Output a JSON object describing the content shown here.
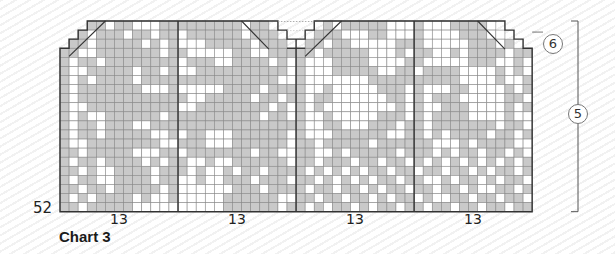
{
  "title": "Chart 3",
  "row_number_label": "52",
  "repeat_labels": [
    "13",
    "13",
    "13",
    "13"
  ],
  "annotations": {
    "circle_top": "6",
    "circle_side": "5"
  },
  "colors": {
    "shaded": "#c9c9c9",
    "white": "#ffffff",
    "gridline": "#8a8a8a",
    "outline": "#333333"
  },
  "grid": {
    "columns": 52,
    "rows": 21,
    "cell_size": 9.08,
    "origin_x": 60,
    "origin_y": 21,
    "panel_dividers": [
      13,
      26,
      39
    ],
    "top_shape": {
      "row_start_cols": [
        [
          3,
          23,
          29,
          48
        ],
        [
          2,
          24,
          28,
          49
        ],
        [
          1,
          25,
          27,
          50
        ]
      ],
      "full_from_row": 3
    },
    "cells": [
      "-1,-1,-1,1,1,0,1,1,0,0,0,1,1,1,1,1,1,1,1,1,0,1,1,-1,-1,-1,-1,-1,-1,1,0,1,1,1,1,1,0,0,0,1,0,0,0,1,1,1,1,0,-1,-1,-1,-1",
      "-1,-1,1,0,1,1,1,0,1,1,0,1,1,0,1,1,1,1,1,1,0,1,1,1,-1,-1,-1,-1,1,1,1,0,0,0,1,1,0,0,0,1,0,0,0,0,1,1,1,0,0,-1,-1,-1",
      "-1,1,1,0,1,1,1,1,1,0,1,0,1,0,0,0,1,1,1,1,1,0,1,1,1,-1,-1,1,1,0,1,1,0,0,0,0,0,1,1,1,0,0,0,0,0,1,1,1,0,1,-1,-1",
      "1,1,0,0,1,1,1,1,1,1,1,0,1,1,0,0,0,0,0,1,1,0,0,1,1,1,1,1,0,1,1,1,1,1,0,0,0,1,0,1,1,0,0,1,0,1,1,1,1,0,1,1",
      "1,0,1,1,0,1,1,1,1,1,1,1,1,0,1,1,1,0,0,1,1,1,1,0,1,0,1,0,0,0,1,1,1,1,0,0,0,0,1,1,0,0,0,0,0,1,1,1,0,0,1,0",
      "1,0,0,1,1,1,1,1,0,1,1,0,1,0,0,1,1,1,1,1,1,1,1,1,1,0,1,0,0,0,1,1,1,1,1,0,0,1,1,0,1,1,1,1,0,0,0,0,1,0,1,0",
      "1,0,1,0,1,1,1,1,0,1,1,1,1,1,1,1,1,1,1,1,1,1,1,1,0,0,1,0,0,0,0,0,0,0,1,1,1,1,1,1,1,1,1,1,0,0,0,0,1,0,0,1",
      "1,0,1,1,1,1,1,1,1,0,0,0,1,0,0,0,0,0,1,1,1,1,0,1,1,1,1,0,0,1,0,0,0,0,0,1,1,1,0,1,0,0,0,1,1,0,0,0,0,1,0,1",
      "1,0,1,1,1,1,1,1,1,1,1,1,1,1,0,0,1,1,1,1,1,0,1,1,0,1,1,0,1,1,0,0,0,0,0,0,1,1,0,1,0,1,1,1,0,0,0,0,0,1,1,0",
      "1,0,0,1,1,1,1,1,1,1,1,1,1,0,0,1,1,1,1,1,1,1,1,0,1,0,1,0,1,0,0,0,0,0,0,0,0,1,0,1,0,0,1,1,1,0,0,0,0,1,0,1",
      "1,0,1,0,0,1,1,1,1,1,1,0,1,1,1,1,1,1,1,1,1,1,0,1,1,0,1,0,0,1,0,0,0,0,0,1,1,1,0,1,0,1,1,1,1,0,0,0,0,1,0,0",
      "1,0,1,1,0,1,1,1,0,0,1,1,1,1,1,1,1,1,1,1,1,1,1,1,1,1,1,0,0,1,1,0,0,0,1,1,1,0,1,1,0,1,1,1,1,1,1,1,0,1,1,0",
      "1,0,1,1,0,1,1,1,1,1,0,0,1,0,1,1,0,0,0,1,1,1,1,1,1,0,1,0,0,0,1,1,1,1,1,1,0,0,1,1,0,1,0,1,1,1,1,0,1,1,0,1",
      "1,0,0,1,1,1,1,1,1,1,1,0,0,1,1,1,0,0,0,1,1,1,1,1,1,0,1,1,0,1,1,1,1,1,0,1,1,1,1,1,1,0,0,0,1,0,1,1,1,1,0,0",
      "1,1,0,1,1,1,1,1,0,0,0,1,1,0,1,1,1,1,1,1,1,0,1,1,0,0,1,1,0,0,1,0,1,1,1,1,1,0,1,1,1,0,1,0,1,1,0,1,1,0,1,0",
      "1,0,1,1,0,1,1,1,1,0,1,0,1,1,0,0,1,0,0,1,1,1,1,1,1,0,1,1,0,1,1,1,0,1,1,0,1,1,0,1,0,1,0,1,0,1,0,1,0,1,0,1",
      "1,1,0,1,0,0,1,1,1,1,0,1,1,1,0,1,0,0,1,0,1,1,0,1,1,1,1,0,1,0,1,0,1,0,1,1,0,1,1,0,1,1,0,1,1,0,1,0,1,1,0,1",
      "1,0,1,1,0,0,1,1,1,1,0,1,1,0,0,1,0,0,1,1,1,0,1,1,1,0,1,1,0,1,0,1,0,1,0,1,1,0,1,1,0,0,1,0,1,1,0,1,0,1,1,0",
      "1,1,0,1,1,0,1,1,1,1,1,0,1,0,0,0,0,0,0,1,1,1,0,1,1,1,1,0,1,1,0,1,1,0,1,0,1,1,0,1,1,0,1,1,0,1,0,0,1,1,0,1",
      "1,0,1,0,1,1,1,1,0,1,0,0,1,0,0,0,0,0,1,1,1,1,1,1,0,0,1,1,0,1,1,0,1,1,0,1,0,1,1,0,1,0,0,1,1,0,1,1,0,1,1,0",
      "1,1,0,1,1,1,1,1,0,0,0,0,0,0,0,0,0,0,1,1,1,1,1,1,0,1,1,0,1,0,1,1,0,1,0,1,1,0,1,1,0,1,1,0,1,1,0,1,1,0,1,1"
    ]
  }
}
